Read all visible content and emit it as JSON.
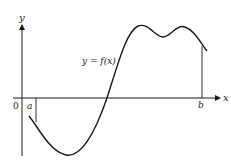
{
  "diagram": {
    "type": "function-graph",
    "axes": {
      "x_label": "x",
      "y_label": "y",
      "origin_label": "0"
    },
    "curve_label": "y = f(x)",
    "interval": {
      "start_label": "a",
      "end_label": "b"
    },
    "colors": {
      "ink": "#1a1a1a",
      "background": "#ffffff"
    }
  }
}
